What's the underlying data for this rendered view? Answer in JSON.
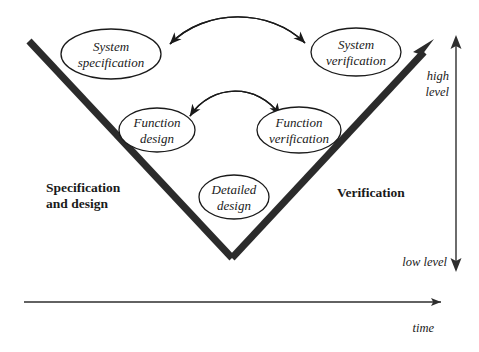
{
  "diagram": {
    "colors": {
      "ink": "#1a1a1a",
      "v_stroke": "#2b2b2b",
      "axis": "#2e2e2e",
      "background": "#ffffff"
    },
    "nodes": [
      {
        "id": "system-specification",
        "line1": "System",
        "line2": "specification",
        "cx": 111,
        "cy": 54,
        "rx": 50,
        "ry": 25
      },
      {
        "id": "system-verification",
        "line1": "System",
        "line2": "verification",
        "cx": 356,
        "cy": 52,
        "rx": 45,
        "ry": 24
      },
      {
        "id": "function-design",
        "line1": "Function",
        "line2": "design",
        "cx": 157,
        "cy": 130,
        "rx": 38,
        "ry": 22
      },
      {
        "id": "function-verification",
        "line1": "Function",
        "line2": "verification",
        "cx": 299,
        "cy": 130,
        "rx": 42,
        "ry": 23
      },
      {
        "id": "detailed-design",
        "line1": "Detailed",
        "line2": "design",
        "cx": 234,
        "cy": 197,
        "rx": 35,
        "ry": 22
      }
    ],
    "phases": [
      {
        "id": "specification-and-design",
        "line1": "Specification",
        "line2": "and design",
        "x": 46,
        "y": 192
      },
      {
        "id": "verification",
        "line1": "Verification",
        "line2": "",
        "x": 337,
        "y": 197
      }
    ],
    "axes": {
      "vertical": {
        "high_label_line1": "high",
        "high_label_line2": "level",
        "low_label": "low level",
        "x": 456,
        "top_y": 37,
        "bottom_y": 270
      },
      "horizontal": {
        "label": "time",
        "y": 302,
        "start_x": 24,
        "end_x": 452
      }
    },
    "arcs": [
      {
        "id": "system-arc",
        "from": "system-specification",
        "to": "system-verification",
        "double_headed": true
      },
      {
        "id": "function-arc",
        "from": "function-design",
        "to": "function-verification",
        "double_headed": true
      }
    ]
  }
}
